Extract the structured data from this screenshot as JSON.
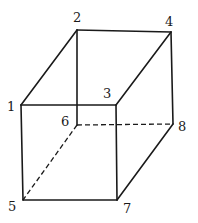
{
  "diagram": {
    "type": "cube-wireframe",
    "vertices": [
      {
        "id": "1",
        "label": "1",
        "x": 21,
        "y": 105,
        "label_x": 7,
        "label_y": 111
      },
      {
        "id": "2",
        "label": "2",
        "x": 77,
        "y": 30,
        "label_x": 73,
        "label_y": 22
      },
      {
        "id": "3",
        "label": "3",
        "x": 116,
        "y": 105,
        "label_x": 103,
        "label_y": 98
      },
      {
        "id": "4",
        "label": "4",
        "x": 171,
        "y": 32,
        "label_x": 165,
        "label_y": 26
      },
      {
        "id": "5",
        "label": "5",
        "x": 23,
        "y": 200,
        "label_x": 8,
        "label_y": 211
      },
      {
        "id": "6",
        "label": "6",
        "x": 77,
        "y": 125,
        "label_x": 61,
        "label_y": 126
      },
      {
        "id": "7",
        "label": "7",
        "x": 117,
        "y": 200,
        "label_x": 123,
        "label_y": 213
      },
      {
        "id": "8",
        "label": "8",
        "x": 173,
        "y": 124,
        "label_x": 178,
        "label_y": 131
      }
    ],
    "edges_solid": [
      [
        "1",
        "2"
      ],
      [
        "2",
        "4"
      ],
      [
        "1",
        "3"
      ],
      [
        "3",
        "4"
      ],
      [
        "1",
        "5"
      ],
      [
        "3",
        "7"
      ],
      [
        "5",
        "7"
      ],
      [
        "4",
        "8"
      ],
      [
        "7",
        "8"
      ],
      [
        "2",
        "6"
      ]
    ],
    "edges_hidden": [
      [
        "6",
        "8"
      ],
      [
        "6",
        "5"
      ]
    ],
    "colors": {
      "line": "#1a1a1a",
      "background": "#ffffff"
    }
  }
}
